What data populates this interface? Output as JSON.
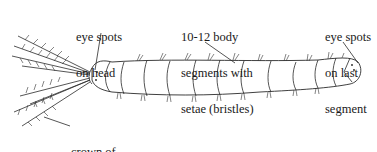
{
  "diagram": {
    "labels": [
      {
        "id": "eye-spots-head",
        "lines": [
          "eye spots",
          "on head"
        ]
      },
      {
        "id": "body-segments",
        "lines": [
          "10-12 body",
          "segments with",
          "setae (bristles)"
        ]
      },
      {
        "id": "eye-spots-tail",
        "lines": [
          "eye spots",
          "on last",
          "segment"
        ]
      },
      {
        "id": "crown-tentacles",
        "lines": [
          "crown of",
          "feathery tentacles"
        ]
      }
    ],
    "colors": {
      "line": "#2a2a2a",
      "background": "#ffffff",
      "text": "#1a1a1a"
    }
  }
}
